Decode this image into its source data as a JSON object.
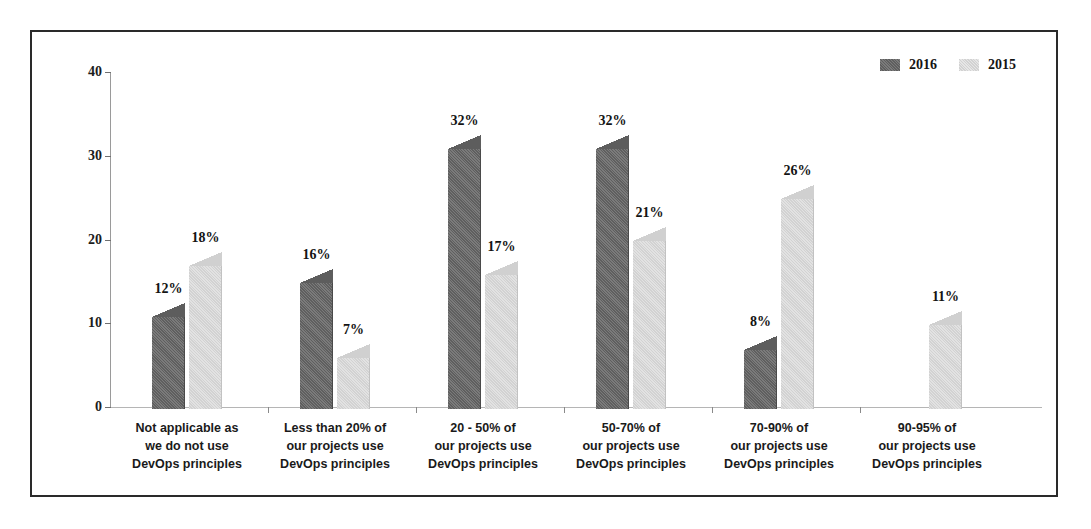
{
  "chart_data": {
    "type": "bar",
    "title": "",
    "subtitle": "",
    "xlabel": "",
    "ylabel": "",
    "ylim": [
      0,
      40
    ],
    "ytick_labels": [
      "0",
      "10",
      "20",
      "30",
      "40"
    ],
    "ytick_values": [
      0,
      10,
      20,
      30,
      40
    ],
    "grid": false,
    "legend_position": "top-right",
    "categories": [
      "Not applicable as\nwe do not use\nDevOps principles",
      "Less than 20% of\nour projects use\nDevOps principles",
      "20 - 50% of\nour projects use\nDevOps principles",
      "50-70% of\nour projects use\nDevOps principles",
      "70-90% of\nour projects use\nDevOps principles",
      "90-95% of\nour projects use\nDevOps principles"
    ],
    "category_lines": [
      [
        "Not applicable as",
        "we do not use",
        "DevOps principles"
      ],
      [
        "Less than 20% of",
        "our projects use",
        "DevOps principles"
      ],
      [
        "20 - 50% of",
        "our projects use",
        "DevOps principles"
      ],
      [
        "50-70% of",
        "our projects use",
        "DevOps principles"
      ],
      [
        "70-90% of",
        "our projects use",
        "DevOps principles"
      ],
      [
        "90-95% of",
        "our projects use",
        "DevOps principles"
      ]
    ],
    "series": [
      {
        "name": "2016",
        "color": "#6b6b6b",
        "values": [
          12,
          16,
          32,
          32,
          8,
          null
        ],
        "data_labels": [
          "12%",
          "16%",
          "32%",
          "32%",
          "8%",
          ""
        ]
      },
      {
        "name": "2015",
        "color": "#dedede",
        "values": [
          18,
          7,
          17,
          21,
          26,
          11
        ],
        "data_labels": [
          "18%",
          "7%",
          "17%",
          "21%",
          "26%",
          "11%"
        ]
      }
    ]
  },
  "legend": {
    "items": [
      {
        "label": "2016",
        "swatch": "dark"
      },
      {
        "label": "2015",
        "swatch": "light"
      }
    ]
  }
}
